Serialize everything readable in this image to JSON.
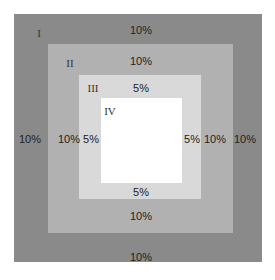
{
  "diagram": {
    "type": "nested-squares",
    "regions": [
      {
        "id": "I",
        "label": "I",
        "color": "#8a8a8a",
        "margins": {
          "top": "10%",
          "left": "10%",
          "right": "10%",
          "bottom": "10%"
        }
      },
      {
        "id": "II",
        "label": "II",
        "color": "#b1b1b1",
        "margins": {
          "top": "10%",
          "left": "10%",
          "right": "10%",
          "bottom": "10%"
        }
      },
      {
        "id": "III",
        "label": "III",
        "color": "#d9d9d9",
        "margins": {
          "top": "5%",
          "left": "5%",
          "right": "5%",
          "bottom": "5%"
        }
      },
      {
        "id": "IV",
        "label": "IV",
        "color": "#ffffff"
      }
    ]
  }
}
